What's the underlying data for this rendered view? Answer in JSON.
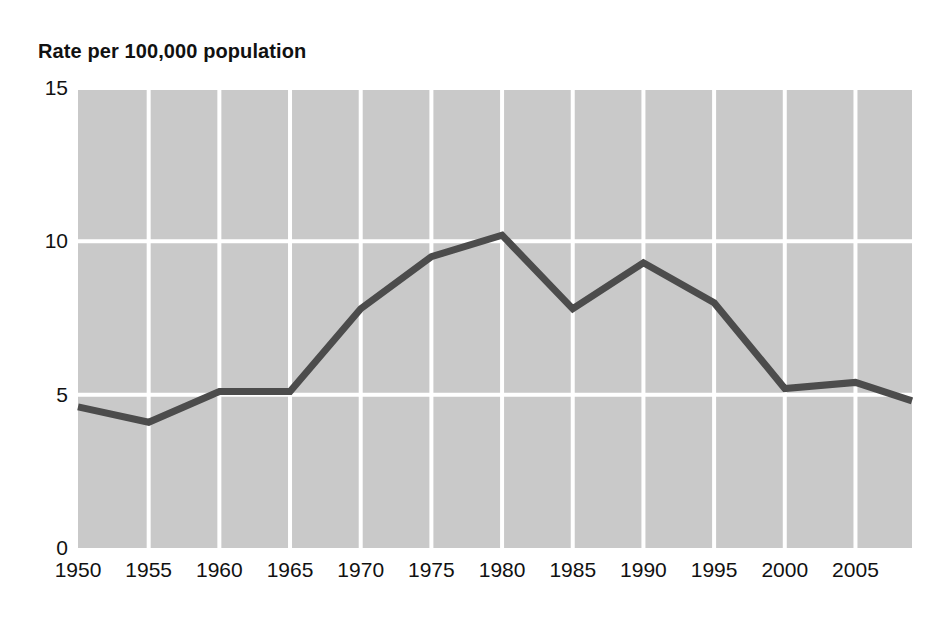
{
  "chart_data": {
    "type": "line",
    "title": "Rate per 100,000 population",
    "xlabel": "",
    "ylabel": "",
    "x": [
      1950,
      1955,
      1960,
      1965,
      1970,
      1975,
      1980,
      1985,
      1990,
      1995,
      2000,
      2005,
      2009
    ],
    "values": [
      4.6,
      4.1,
      5.1,
      5.1,
      7.8,
      9.5,
      10.2,
      7.8,
      9.3,
      8.0,
      5.2,
      5.4,
      4.8
    ],
    "series": [
      {
        "name": "Rate per 100,000 population",
        "values": [
          4.6,
          4.1,
          5.1,
          5.1,
          7.8,
          9.5,
          10.2,
          7.8,
          9.3,
          8.0,
          5.2,
          5.4,
          4.8
        ]
      }
    ],
    "xlim": [
      1950,
      2009
    ],
    "ylim": [
      0,
      15
    ],
    "yticks": [
      0,
      5,
      10,
      15
    ],
    "ytick_labels": [
      "0",
      "5",
      "10",
      "15"
    ],
    "xticks": [
      1950,
      1955,
      1960,
      1965,
      1970,
      1975,
      1980,
      1985,
      1990,
      1995,
      2000,
      2005
    ],
    "xtick_labels": [
      "1950",
      "1955",
      "1960",
      "1965",
      "1970",
      "1975",
      "1980",
      "1985",
      "1990",
      "1995",
      "2000",
      "2005"
    ],
    "grid": true,
    "legend": "none",
    "colors": {
      "line": "#4c4c4c",
      "plot_background": "#c9c9c9",
      "grid": "#ffffff",
      "text": "#111111",
      "figure_background": "#ffffff"
    },
    "line_width": 7
  }
}
